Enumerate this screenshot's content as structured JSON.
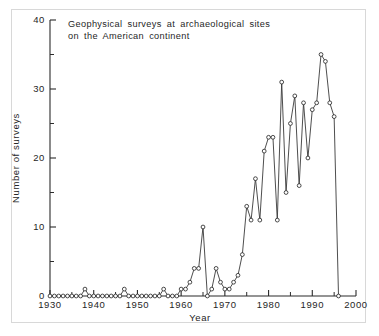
{
  "figure": {
    "title_line1": "Geophysical surveys at archaeological sites",
    "title_line2": "on the American continent",
    "background_color": "#ffffff",
    "ink_color": "#2b2b2b"
  },
  "chart_data": {
    "type": "line",
    "title": "Geophysical surveys at archaeological sites on the American continent",
    "xlabel": "Year",
    "ylabel": "Number of surveys",
    "xlim": [
      1930,
      2000
    ],
    "ylim": [
      0,
      40
    ],
    "grid": false,
    "legend": null,
    "marker": "open-circle",
    "x_major_ticks": [
      1930,
      1940,
      1950,
      1960,
      1970,
      1980,
      1990,
      2000
    ],
    "x_major_tick_labels": [
      "1930",
      "1940",
      "1950",
      "1960",
      "1970",
      "1980",
      "1990",
      "2000"
    ],
    "x_minor_ticks": [
      1935,
      1945,
      1955,
      1965,
      1975,
      1985,
      1995
    ],
    "y_major_ticks": [
      0,
      10,
      20,
      30,
      40
    ],
    "y_major_tick_labels": [
      "0",
      "10",
      "20",
      "30",
      "40"
    ],
    "y_minor_ticks": [
      5,
      15,
      25,
      35
    ],
    "x": [
      1930,
      1931,
      1932,
      1933,
      1934,
      1935,
      1936,
      1937,
      1938,
      1939,
      1940,
      1941,
      1942,
      1943,
      1944,
      1945,
      1946,
      1947,
      1948,
      1949,
      1950,
      1951,
      1952,
      1953,
      1954,
      1955,
      1956,
      1957,
      1958,
      1959,
      1960,
      1961,
      1962,
      1963,
      1964,
      1965,
      1966,
      1967,
      1968,
      1969,
      1970,
      1971,
      1972,
      1973,
      1974,
      1975,
      1976,
      1977,
      1978,
      1979,
      1980,
      1981,
      1982,
      1983,
      1984,
      1985,
      1986,
      1987,
      1988,
      1989,
      1990,
      1991,
      1992,
      1993,
      1994,
      1995,
      1996
    ],
    "y": [
      0,
      0,
      0,
      0,
      0,
      0,
      0,
      0,
      1,
      0,
      0,
      0,
      0,
      0,
      0,
      0,
      0,
      1,
      0,
      0,
      0,
      0,
      0,
      0,
      0,
      0,
      1,
      0,
      0,
      0,
      1,
      1,
      2,
      4,
      4,
      10,
      0,
      1,
      4,
      2,
      1,
      1,
      2,
      3,
      6,
      13,
      11,
      17,
      11,
      21,
      23,
      23,
      11,
      31,
      15,
      25,
      29,
      16,
      28,
      20,
      27,
      28,
      35,
      34,
      28,
      26,
      0
    ],
    "series_note": "Annual count of geophysical surveys; open-circle markers connected by a thin line"
  },
  "axes": {
    "x_title": "Year",
    "y_title": "Number of surveys"
  }
}
